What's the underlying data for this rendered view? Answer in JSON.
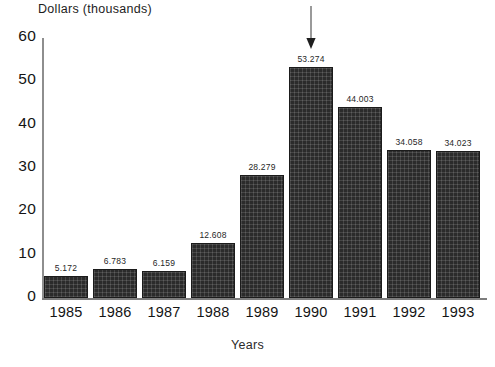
{
  "chart_data": {
    "type": "bar",
    "title": "",
    "ylabel": "Dollars (thousands)",
    "xlabel": "Years",
    "categories": [
      "1985",
      "1986",
      "1987",
      "1988",
      "1989",
      "1990",
      "1991",
      "1992",
      "1993"
    ],
    "values": [
      5.172,
      6.783,
      6.159,
      12.608,
      28.279,
      53.274,
      44.003,
      34.058,
      34.023
    ],
    "data_labels": [
      "5.172",
      "6.783",
      "6.159",
      "12.608",
      "28.279",
      "53.274",
      "44.003",
      "34.058",
      "34.023"
    ],
    "ylim": [
      0,
      60
    ],
    "y_ticks": [
      0,
      10,
      20,
      30,
      40,
      50,
      60
    ],
    "y_tick_labels": [
      "0",
      "10",
      "20",
      "30",
      "40",
      "50",
      "60"
    ],
    "grid": false,
    "legend": null,
    "bar_color": "#2b2b2b",
    "annotations": [
      {
        "type": "arrow",
        "direction": "down",
        "target_category": "1990",
        "target_value": 53.274,
        "text": ""
      }
    ]
  }
}
